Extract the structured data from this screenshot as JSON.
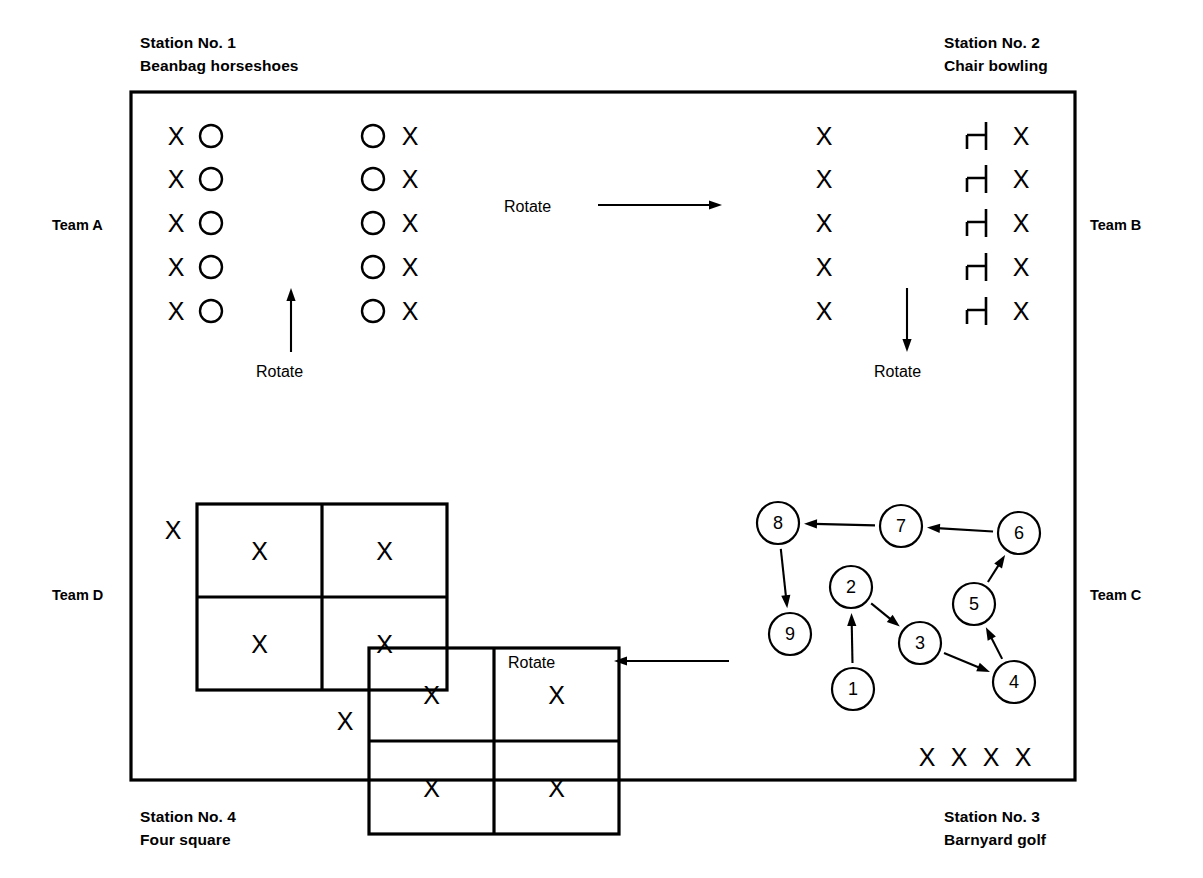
{
  "diagram": {
    "court": {
      "x": 131,
      "y": 92,
      "width": 944,
      "height": 688
    },
    "stations": [
      {
        "id": "station-1",
        "number_label": "Station No. 1",
        "activity_label": "Beanbag horseshoes",
        "position": "top-left",
        "label_x": 140,
        "label_y": 48
      },
      {
        "id": "station-2",
        "number_label": "Station No. 2",
        "activity_label": "Chair bowling",
        "position": "top-right",
        "label_x": 944,
        "label_y": 48
      },
      {
        "id": "station-3",
        "number_label": "Station No. 3",
        "activity_label": "Barnyard golf",
        "position": "bottom-right",
        "label_x": 944,
        "label_y": 822
      },
      {
        "id": "station-4",
        "number_label": "Station No. 4",
        "activity_label": "Four square",
        "position": "bottom-left",
        "label_x": 140,
        "label_y": 822
      }
    ],
    "teams": [
      {
        "id": "team-a",
        "label": "Team A",
        "x": 52,
        "y": 230
      },
      {
        "id": "team-b",
        "label": "Team B",
        "x": 1090,
        "y": 230
      },
      {
        "id": "team-c",
        "label": "Team C",
        "x": 1090,
        "y": 600
      },
      {
        "id": "team-d",
        "label": "Team D",
        "x": 52,
        "y": 600
      }
    ],
    "rotate_arrows": [
      {
        "id": "rotate-top",
        "label": "Rotate",
        "direction": "right",
        "label_x": 504,
        "label_y": 212,
        "line": {
          "x1": 598,
          "y1": 205,
          "x2": 722,
          "y2": 205
        }
      },
      {
        "id": "rotate-left",
        "label": "Rotate",
        "direction": "up",
        "label_x": 256,
        "label_y": 377,
        "line": {
          "x1": 291,
          "y1": 352,
          "x2": 291,
          "y2": 288
        }
      },
      {
        "id": "rotate-right",
        "label": "Rotate",
        "direction": "down",
        "label_x": 874,
        "label_y": 377,
        "line": {
          "x1": 907,
          "y1": 288,
          "x2": 907,
          "y2": 352
        }
      },
      {
        "id": "rotate-bottom",
        "label": "Rotate",
        "direction": "left",
        "label_x": 508,
        "label_y": 668,
        "line": {
          "x1": 729,
          "y1": 661,
          "x2": 614,
          "y2": 661
        }
      }
    ],
    "station1_beanbag": {
      "row_y": [
        136,
        179,
        223,
        267,
        311
      ],
      "left_pair": {
        "x_mark": 176,
        "o_mark": 211
      },
      "right_pair": {
        "o_mark": 373,
        "x_mark": 410
      },
      "x_symbol": "X",
      "o_symbol": "O",
      "o_radius": 11
    },
    "station2_chairbowling": {
      "row_y": [
        136,
        179,
        223,
        267,
        311
      ],
      "pin_x": 824,
      "chair_x": 977,
      "bowler_x": 1021,
      "x_symbol": "X",
      "chair_symbol": "chair-profile"
    },
    "station4_foursquare": {
      "x_symbol": "X",
      "grids": [
        {
          "id": "four-square-grid-upper",
          "x": 197,
          "y": 504,
          "width": 125,
          "height": 93,
          "waiting_x": 173,
          "waiting_y": 530,
          "cells": [
            "X",
            "X",
            "X",
            "X"
          ]
        },
        {
          "id": "four-square-grid-lower",
          "x": 369,
          "y": 648,
          "width": 125,
          "height": 93,
          "waiting_x": 345,
          "waiting_y": 721,
          "cells": [
            "X",
            "X",
            "X",
            "X"
          ]
        }
      ]
    },
    "station3_barnyardgolf": {
      "circle_radius": 21,
      "nodes": [
        {
          "label": "1",
          "cx": 853,
          "cy": 689
        },
        {
          "label": "2",
          "cx": 851,
          "cy": 587
        },
        {
          "label": "3",
          "cx": 920,
          "cy": 643
        },
        {
          "label": "4",
          "cx": 1014,
          "cy": 682
        },
        {
          "label": "5",
          "cx": 974,
          "cy": 604
        },
        {
          "label": "6",
          "cx": 1019,
          "cy": 533
        },
        {
          "label": "7",
          "cx": 901,
          "cy": 526
        },
        {
          "label": "8",
          "cx": 778,
          "cy": 523
        },
        {
          "label": "9",
          "cx": 790,
          "cy": 634
        }
      ],
      "path_sequence": [
        "1",
        "2",
        "3",
        "4",
        "5",
        "6",
        "7",
        "8",
        "9"
      ],
      "waiting_players": {
        "label": "X",
        "count": 4,
        "y": 757,
        "x_positions": [
          927,
          959,
          991,
          1023
        ]
      }
    }
  }
}
